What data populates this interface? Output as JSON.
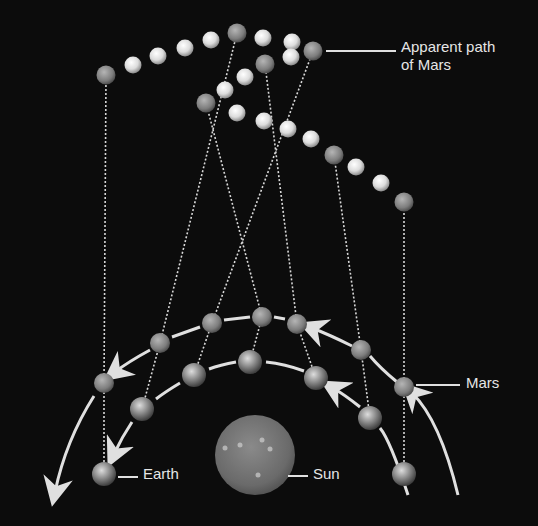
{
  "diagram": {
    "labels": {
      "apparent_path_line1": "Apparent path",
      "apparent_path_line2": "of Mars",
      "mars": "Mars",
      "earth": "Earth",
      "sun": "Sun"
    },
    "colors": {
      "background": "#0c0c0c",
      "path_ball": "#e8e8e8",
      "planet_marker": "#8a8a8a",
      "arrow": "#e0e0e0",
      "sun": "#6f6f6f"
    },
    "sun": {
      "x": 255,
      "y": 455,
      "r": 40
    },
    "earth_positions": [
      [
        104,
        474
      ],
      [
        142,
        409
      ],
      [
        194,
        375
      ],
      [
        250,
        362
      ],
      [
        316,
        378
      ],
      [
        370,
        418
      ],
      [
        404,
        474
      ]
    ],
    "mars_positions": [
      [
        104,
        383
      ],
      [
        160,
        343
      ],
      [
        212,
        323
      ],
      [
        262,
        317
      ],
      [
        297,
        324
      ],
      [
        361,
        350
      ],
      [
        404,
        387
      ]
    ],
    "apparent_positions": [
      [
        106,
        75
      ],
      [
        237,
        33
      ],
      [
        313,
        51
      ],
      [
        206,
        103
      ],
      [
        265,
        64
      ],
      [
        334,
        155
      ],
      [
        404,
        202
      ]
    ],
    "apparent_fill_balls": [
      [
        133,
        65
      ],
      [
        158,
        56
      ],
      [
        185,
        48
      ],
      [
        211,
        40
      ],
      [
        263,
        38
      ],
      [
        292,
        42
      ],
      [
        291,
        57
      ],
      [
        225,
        90
      ],
      [
        245,
        77
      ],
      [
        237,
        113
      ],
      [
        264,
        121
      ],
      [
        288,
        129
      ],
      [
        311,
        139
      ],
      [
        356,
        167
      ],
      [
        381,
        183
      ]
    ]
  }
}
